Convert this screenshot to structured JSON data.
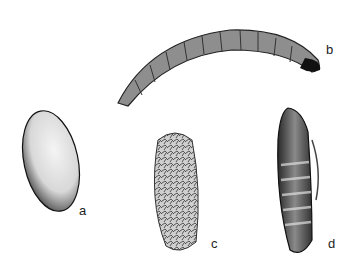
{
  "figure": {
    "panels": [
      {
        "id": "a",
        "label": "a",
        "subject": "egg"
      },
      {
        "id": "b",
        "label": "b",
        "subject": "larva"
      },
      {
        "id": "c",
        "label": "c",
        "subject": "cocoon"
      },
      {
        "id": "d",
        "label": "d",
        "subject": "pupa"
      }
    ]
  }
}
